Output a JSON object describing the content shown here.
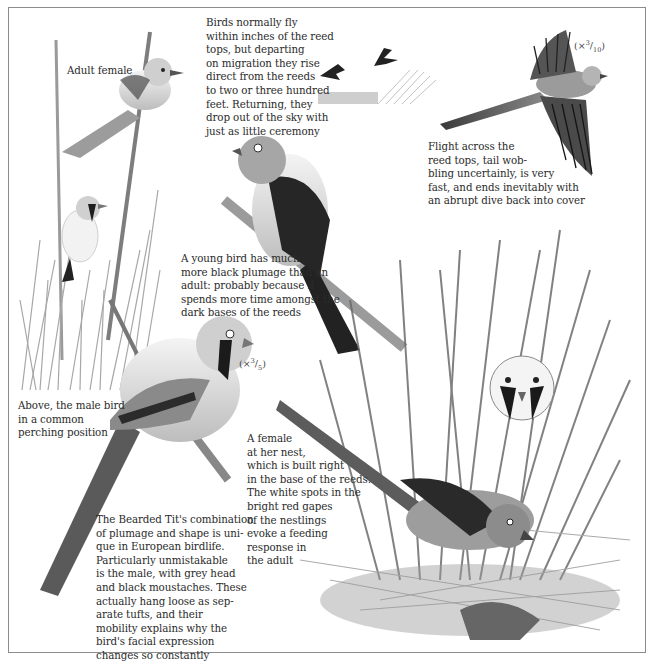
{
  "page": {
    "subject": "Bearded Tit",
    "palette": {
      "background": "#ffffff",
      "frame": "#8c8c8c",
      "text": "#2b2b2b",
      "ink_dark": "#1e1e1e",
      "ink_mid": "#7a7a7a",
      "ink_light": "#c4c4c4"
    }
  },
  "captions": {
    "adult_female": "Adult female",
    "migration": "Birds normally fly\nwithin inches of the reed\ntops, but departing\non migration they rise\ndirect from the reeds\nto two or three hundred\nfeet. Returning, they\ndrop out of the sky with\njust as little ceremony",
    "flight": "Flight across the\nreed tops, tail wob-\nbling uncertainly, is very\nfast, and ends inevitably with\nan abrupt dive back into cover",
    "young_bird": "A young bird has much\nmore black plumage than an\nadult: probably because it\nspends more time amongst the\ndark bases of the reeds",
    "male_perching": "Above, the male bird\nin a common\nperching position",
    "female_nest": "A female\nat her nest,\nwhich is built right\nin the base of the reeds.\nThe white spots in the\nbright red gapes\nof the nestlings\nevoke a feeding\nresponse in\nthe adult",
    "main_text": "The Bearded Tit's combination\nof plumage and shape is uni-\nque in European birdlife.\nParticularly unmistakable\nis the male, with grey head\nand black moustaches. These\nactually hang loose as sep-\narate tufts, and their\nmobility explains why the\nbird's facial expression\nchanges so constantly"
  },
  "scales": {
    "flight_bird": {
      "prefix": "(×",
      "num": "3",
      "den": "10",
      "suffix": ")"
    },
    "large_male": {
      "prefix": "(×",
      "num": "3",
      "den": "5",
      "suffix": ")"
    }
  },
  "illustrations": [
    {
      "id": "adult-female-on-reed",
      "label": "Adult female perched on reed stem"
    },
    {
      "id": "male-in-reeds",
      "label": "Male bird among reeds"
    },
    {
      "id": "migrating-birds",
      "label": "Two small birds rising from reed tops"
    },
    {
      "id": "bird-in-flight",
      "label": "Bird in flight with wings spread"
    },
    {
      "id": "young-bird",
      "label": "Young bird perched on slanted reed"
    },
    {
      "id": "male-perching",
      "label": "Male bird in common perching position"
    },
    {
      "id": "nest-scene",
      "label": "Male and female at nest with nestlings"
    }
  ]
}
